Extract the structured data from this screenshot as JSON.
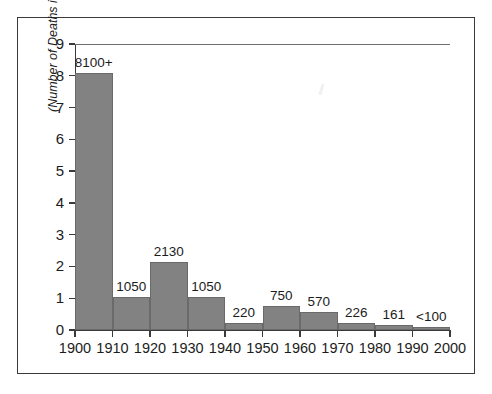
{
  "chart_data": {
    "type": "bar",
    "title": "",
    "xlabel": "",
    "ylabel": "(Number of Deaths in Thousands)",
    "categories": [
      "1900",
      "1910",
      "1920",
      "1930",
      "1940",
      "1950",
      "1960",
      "1970",
      "1980",
      "1990"
    ],
    "values": [
      8.1,
      1.05,
      2.13,
      1.05,
      0.22,
      0.75,
      0.57,
      0.226,
      0.161,
      0.1
    ],
    "bar_labels": [
      "8100+",
      "1050",
      "2130",
      "1050",
      "220",
      "750",
      "570",
      "226",
      "161",
      "<100"
    ],
    "x_tick_labels": [
      "1900",
      "1910",
      "1920",
      "1930",
      "1940",
      "1950",
      "1960",
      "1970",
      "1980",
      "1990",
      "2000"
    ],
    "y_tick_labels": [
      "0",
      "1",
      "2",
      "3",
      "4",
      "5",
      "6",
      "7",
      "8",
      "9"
    ],
    "y_tick_values": [
      0,
      1,
      2,
      3,
      4,
      5,
      6,
      7,
      8,
      9
    ],
    "ylim": [
      0,
      9
    ],
    "xlim": [
      1900,
      2000
    ],
    "grid": false,
    "legend": false,
    "bar_color": "#828282",
    "axis_color": "#3a3a3a",
    "text_color": "#1c1c1c"
  }
}
